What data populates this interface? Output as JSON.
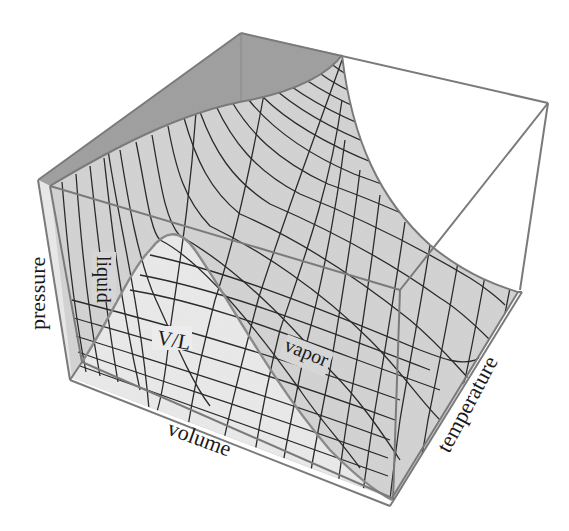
{
  "figure": {
    "type": "3D P-V-T surface diagram",
    "axes": {
      "vertical": "pressure",
      "front": "volume",
      "side": "temperature"
    },
    "region_labels": {
      "liquid": "liquid",
      "vapor": "vapor",
      "coexistence": "V/L"
    },
    "colors": {
      "background": "#ffffff",
      "surface": "#d6d6d6",
      "dome_floor": "#e6e6e6",
      "back_wall": "#a3a3a3",
      "box_edge": "#7a7a7a",
      "grid_line": "#2b2b2b",
      "dome_outline": "#8a8a8a",
      "text": "#1a1a1a"
    }
  }
}
